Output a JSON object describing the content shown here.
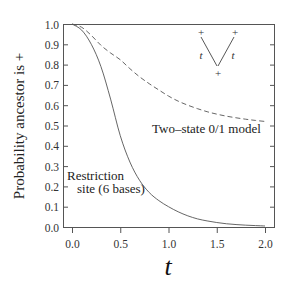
{
  "chart_data": {
    "type": "line",
    "title": "",
    "xlabel": "t",
    "ylabel": "Probability ancestor is +",
    "xlim": [
      -0.1,
      2.1
    ],
    "ylim": [
      0.0,
      1.0
    ],
    "grid": false,
    "x_ticks": [
      "0.0",
      "0.5",
      "1.0",
      "1.5",
      "2.0"
    ],
    "x_tick_values": [
      0.0,
      0.5,
      1.0,
      1.5,
      2.0
    ],
    "y_ticks": [
      "0.0",
      "0.1",
      "0.2",
      "0.3",
      "0.4",
      "0.5",
      "0.6",
      "0.7",
      "0.8",
      "0.9",
      "1.0"
    ],
    "y_tick_values": [
      0.0,
      0.1,
      0.2,
      0.3,
      0.4,
      0.5,
      0.6,
      0.7,
      0.8,
      0.9,
      1.0
    ],
    "x": [
      0.0,
      0.1,
      0.2,
      0.3,
      0.4,
      0.5,
      0.6,
      0.7,
      0.8,
      0.9,
      1.0,
      1.1,
      1.2,
      1.3,
      1.4,
      1.5,
      1.6,
      1.7,
      1.8,
      1.9,
      2.0
    ],
    "series": [
      {
        "name": "Two-state 0/1 model",
        "style": "dashed",
        "values": [
          1.0,
          0.984,
          0.944,
          0.895,
          0.857,
          0.824,
          0.78,
          0.74,
          0.706,
          0.675,
          0.645,
          0.62,
          0.6,
          0.583,
          0.568,
          0.556,
          0.546,
          0.538,
          0.531,
          0.525,
          0.52
        ]
      },
      {
        "name": "Restriction site (6 bases)",
        "style": "solid",
        "values": [
          1.0,
          0.97,
          0.9,
          0.79,
          0.63,
          0.45,
          0.32,
          0.23,
          0.17,
          0.13,
          0.1,
          0.075,
          0.055,
          0.04,
          0.03,
          0.022,
          0.016,
          0.012,
          0.009,
          0.007,
          0.005
        ]
      }
    ],
    "annotations": [
      {
        "text": "Two–state  0/1 model",
        "target": "dashed"
      },
      {
        "text_line1": "Restriction",
        "text_line2": "site (6 bases)",
        "target": "solid"
      }
    ],
    "inset_tree": {
      "leaf_left": "+",
      "leaf_right": "+",
      "root": "+",
      "branch_left_label": "t",
      "branch_right_label": "t"
    }
  },
  "labels": {
    "ylabel": "Probability ancestor is  +",
    "xlabel": "t",
    "two_state": "Two–state  0/1 model",
    "restriction_line1": "Restriction",
    "restriction_line2": "site (6 bases)"
  }
}
